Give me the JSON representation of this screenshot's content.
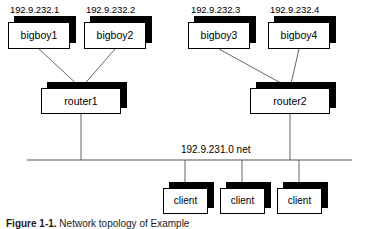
{
  "diagram": {
    "background_color": "#ffffff",
    "line_color": "#555555",
    "box_fill": "#ffffff",
    "box_stroke": "#000000",
    "shadow_color": "#000000",
    "network_label": "192.9.231.0 net",
    "ip_labels": [
      {
        "text": "192.9.232.1",
        "x": 10,
        "y": 4
      },
      {
        "text": "192.9.232.2",
        "x": 86,
        "y": 4
      },
      {
        "text": "192.9.232.3",
        "x": 191,
        "y": 4
      },
      {
        "text": "192.9.232.4",
        "x": 270,
        "y": 4
      }
    ],
    "hosts": [
      {
        "label": "bigboy1",
        "x": 8,
        "y": 22,
        "w": 62,
        "h": 27
      },
      {
        "label": "bigboy2",
        "x": 84,
        "y": 22,
        "w": 62,
        "h": 27
      },
      {
        "label": "bigboy3",
        "x": 188,
        "y": 22,
        "w": 62,
        "h": 27
      },
      {
        "label": "bigboy4",
        "x": 268,
        "y": 22,
        "w": 62,
        "h": 27
      }
    ],
    "routers": [
      {
        "label": "router1",
        "x": 41,
        "y": 88,
        "w": 80,
        "h": 26
      },
      {
        "label": "router2",
        "x": 250,
        "y": 88,
        "w": 80,
        "h": 26
      }
    ],
    "clients": [
      {
        "label": "client",
        "x": 163,
        "y": 188,
        "w": 45,
        "h": 26
      },
      {
        "label": "client",
        "x": 220,
        "y": 188,
        "w": 45,
        "h": 26
      },
      {
        "label": "client",
        "x": 277,
        "y": 188,
        "w": 45,
        "h": 26
      }
    ],
    "bus": {
      "x1": 27,
      "x2": 352,
      "y": 160
    },
    "host_to_router_links": [
      {
        "x1": 39,
        "y1": 49,
        "x2": 81,
        "y2": 88
      },
      {
        "x1": 115,
        "y1": 49,
        "x2": 81,
        "y2": 88
      },
      {
        "x1": 219,
        "y1": 49,
        "x2": 290,
        "y2": 88
      },
      {
        "x1": 299,
        "y1": 49,
        "x2": 290,
        "y2": 88
      }
    ],
    "router_to_bus_links": [
      {
        "x": 81,
        "y1": 114,
        "y2": 160
      },
      {
        "x": 290,
        "y1": 114,
        "y2": 160
      }
    ],
    "client_to_bus_links": [
      {
        "x": 185,
        "y1": 160,
        "y2": 188
      },
      {
        "x": 242,
        "y1": 160,
        "y2": 188
      },
      {
        "x": 299,
        "y1": 160,
        "y2": 188
      }
    ],
    "network_label_pos": {
      "x": 178,
      "y": 144
    },
    "caption": {
      "number": "Figure 1-1.",
      "text": "Network topology of Example",
      "x": 6,
      "y": 218
    }
  }
}
